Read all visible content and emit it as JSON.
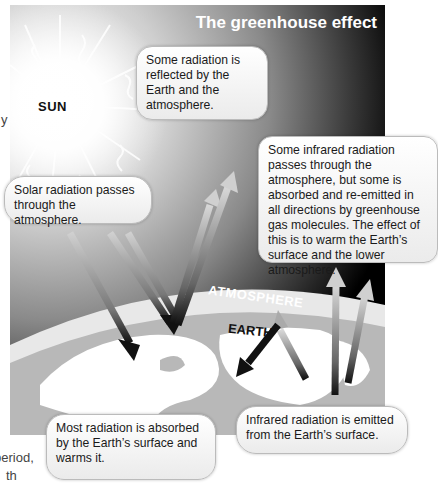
{
  "diagram": {
    "title": "The greenhouse effect",
    "sun_label": "SUN",
    "atmosphere_label": "ATMOSPHERE",
    "earth_label": "EARTH",
    "callouts": {
      "reflected": "Some radiation is reflected by the Earth and the atmosphere.",
      "solar": "Solar radiation passes through the atmosphere.",
      "infrared": "Some infrared radiation passes through the atmosphere, but some is absorbed and re-emitted in all directions by greenhouse gas molecules. The effect of this is to warm the Earth’s surface and the lower atmosphere.",
      "absorbed": "Most radiation is absorbed by the Earth’s surface and warms it.",
      "emitted": "Infrared radiation is emitted from the Earth’s surface."
    },
    "colors": {
      "space": "#000000",
      "earth_land": "#ffffff",
      "earth_ocean": "#b5b5b5",
      "atmosphere_band": "#e6e6e6",
      "arrow_light": "#c8c8c8",
      "arrow_dark": "#111111"
    }
  },
  "page_fragments": {
    "left_edge_1": "y",
    "left_edge_2": "period,",
    "left_edge_3": "th"
  }
}
